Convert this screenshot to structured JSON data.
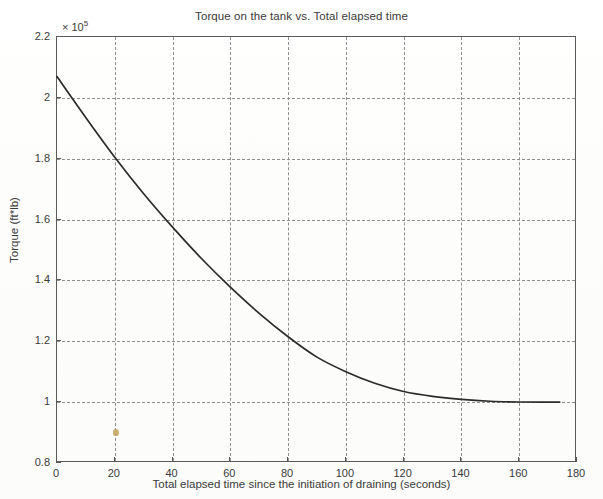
{
  "chart_data": {
    "type": "line",
    "title": "Torque on the tank vs. Total elapsed time",
    "xlabel": "Total elapsed time since the initiation of draining (seconds)",
    "ylabel": "Torque (ft*lb)",
    "y_multiplier_prefix": "× 10",
    "y_multiplier_exponent": "5",
    "xlim": [
      0,
      180
    ],
    "ylim": [
      0.8,
      2.2
    ],
    "xticks": [
      0,
      20,
      40,
      60,
      80,
      100,
      120,
      140,
      160,
      180
    ],
    "xtick_labels": [
      "0",
      "20",
      "40",
      "60",
      "80",
      "100",
      "120",
      "140",
      "160",
      "180"
    ],
    "yticks": [
      0.8,
      1.0,
      1.2,
      1.4,
      1.6,
      1.8,
      2.0,
      2.2
    ],
    "ytick_labels": [
      "0.8",
      "1",
      "1.2",
      "1.4",
      "1.6",
      "1.8",
      "2",
      "2.2"
    ],
    "grid": true,
    "grid_style": "dashed",
    "legend": "none",
    "series": [
      {
        "name": "Torque",
        "x": [
          0,
          10,
          20,
          30,
          40,
          50,
          60,
          70,
          80,
          90,
          100,
          110,
          120,
          130,
          140,
          150,
          160,
          170,
          174
        ],
        "y": [
          2.07,
          1.935,
          1.805,
          1.685,
          1.575,
          1.47,
          1.375,
          1.285,
          1.205,
          1.13,
          1.2,
          1.145,
          1.095,
          1.055,
          1.03,
          1.015,
          1.005,
          1.0,
          1.0
        ],
        "y_units": "1e5 ft*lb",
        "color": "#2b2b2b"
      }
    ]
  },
  "artifacts": {
    "scan_speck": {
      "name": "scan-speck",
      "x_data": 20,
      "y_data": 0.9,
      "color": "#c4a45e"
    }
  }
}
